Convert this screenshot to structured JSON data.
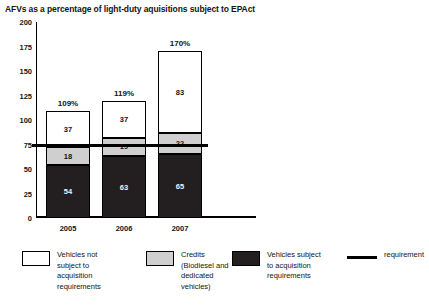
{
  "chart_data": {
    "type": "bar",
    "title": "AFVs as a percentage of light-duty aquisitions subject to EPAct",
    "xlabel": "",
    "ylabel": "",
    "ylim": [
      0,
      200
    ],
    "yticks": [
      0,
      25,
      50,
      75,
      100,
      125,
      150,
      175,
      200
    ],
    "grid": false,
    "stacked": true,
    "legend_position": "bottom",
    "categories": [
      "2005",
      "2006",
      "2007"
    ],
    "series": [
      {
        "name": "Vehicles subject to acquisition requirements",
        "color": "#231f20",
        "values": [
          54,
          63,
          65
        ]
      },
      {
        "name": "Credits (Biodiesel and dedicated vehicles)",
        "color": "#cfcfcf",
        "values": [
          18,
          19,
          22
        ]
      },
      {
        "name": "Vehicles not subject to acquisition requirements",
        "color": "#ffffff",
        "values": [
          37,
          37,
          83
        ]
      }
    ],
    "totals": [
      "109%",
      "119%",
      "170%"
    ],
    "annotations": [
      {
        "name": "requirement",
        "type": "hline",
        "value": 75,
        "color": "#000000"
      }
    ]
  },
  "axis": {
    "y_ticks": [
      "200",
      "175",
      "150",
      "125",
      "100",
      "75",
      "50",
      "25",
      "0"
    ],
    "x_ticks": [
      "2005",
      "2006",
      "2007"
    ]
  },
  "bars": [
    {
      "year": "2005",
      "total_label": "109%",
      "dark_label": "54",
      "gray_label": "18",
      "white_label": "37"
    },
    {
      "year": "2006",
      "total_label": "119%",
      "dark_label": "63",
      "gray_label": "19",
      "white_label": "37"
    },
    {
      "year": "2007",
      "total_label": "170%",
      "dark_label": "65",
      "gray_label": "22",
      "white_label": "83"
    }
  ],
  "legend": {
    "items": [
      {
        "swatch": "white",
        "label": "Vehicles not\nsubject to\nacquisition\nrequirements"
      },
      {
        "swatch": "gray",
        "label": "Credits\n(Biodiesel and\ndedicated\nvehicles)"
      },
      {
        "swatch": "dark",
        "label": "Vehicles subject\nto acquisition\nrequirements"
      },
      {
        "swatch": "line",
        "label": "requirement"
      }
    ]
  }
}
